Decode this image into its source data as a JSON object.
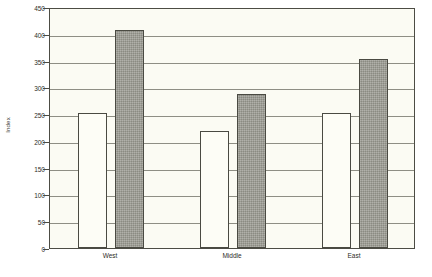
{
  "chart_data": {
    "type": "bar",
    "title": "",
    "xlabel": "",
    "ylabel": "Index",
    "categories": [
      "West",
      "Middle",
      "East"
    ],
    "series": [
      {
        "name": "series-1",
        "fill": "white",
        "values": [
          252,
          218,
          252
        ]
      },
      {
        "name": "series-2",
        "fill": "shaded",
        "values": [
          408,
          288,
          353
        ]
      }
    ],
    "ylim": [
      0,
      450
    ],
    "yticks": [
      0,
      50,
      100,
      150,
      200,
      250,
      300,
      350,
      400,
      450
    ],
    "ytick_labels": [
      "0",
      "50",
      "100",
      "150",
      "200",
      "250",
      "300",
      "350",
      "400",
      "450"
    ],
    "grid": true,
    "grid_axis": "y",
    "legend": "none",
    "colors": {
      "plot_background": "#fbfbf3",
      "frame": "#4c4c44",
      "gridline": "#8e8e84",
      "bar_white_fill": "#fdfdf6",
      "bar_shaded_fill": "#9b9b92",
      "bar_edge": "#4a4a42",
      "text": "#2d2d28"
    }
  }
}
